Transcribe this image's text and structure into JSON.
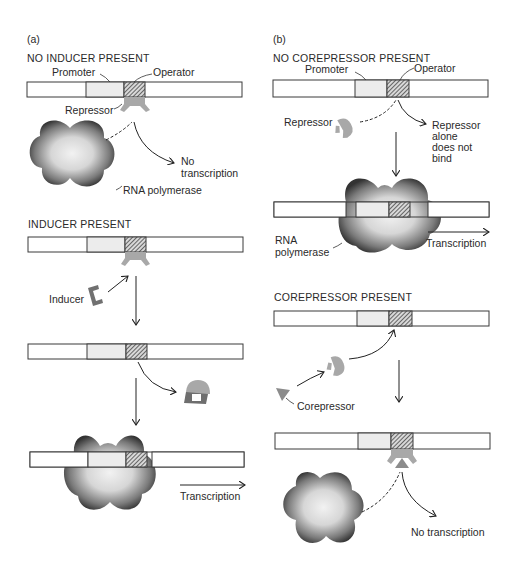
{
  "panels": [
    {
      "label": "(a)",
      "title": "Inducible operon (lac-type) regulation",
      "states": [
        {
          "heading": "NO INDUCER PRESENT",
          "labels": {
            "promoter": "Promoter",
            "operator": "Operator",
            "repressor": "Repressor",
            "outcome": [
              "No",
              "transcription"
            ],
            "polymerase": "RNA polymerase"
          }
        },
        {
          "heading": "INDUCER PRESENT",
          "labels": {
            "inducer": "Inducer",
            "outcome": "Transcription"
          }
        }
      ]
    },
    {
      "label": "(b)",
      "title": "Repressible operon (trp-type) regulation",
      "states": [
        {
          "heading": "NO COREPRESSOR PRESENT",
          "labels": {
            "promoter": "Promoter",
            "operator": "Operator",
            "repressor": "Repressor",
            "note": [
              "Repressor",
              "alone",
              "does not",
              "bind"
            ],
            "polymerase": [
              "RNA",
              "polymerase"
            ],
            "outcome": "Transcription"
          }
        },
        {
          "heading": "COREPRESSOR PRESENT",
          "labels": {
            "corepressor": "Corepressor",
            "outcome": "No transcription"
          }
        }
      ]
    }
  ],
  "colors": {
    "dna_fill": "#ffffff",
    "dna_outline": "#3a3a3a",
    "promoter_fill": "#ececec",
    "operator_hatch": "#3a3a3a",
    "repressor": "#a8a8a8",
    "inducer": "#707070",
    "corepressor": "#8c8c8c",
    "polymerase_dark": "#3a3a3a",
    "polymerase_light": "#e6e6e6"
  }
}
